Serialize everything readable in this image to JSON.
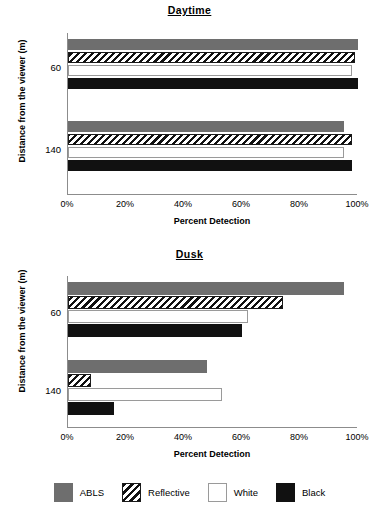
{
  "chart_data": [
    {
      "type": "bar",
      "orientation": "horizontal",
      "title": "Daytime",
      "xlabel": "Percent Detection",
      "ylabel": "Distance from the viewer (m)",
      "categories": [
        "60",
        "140"
      ],
      "xlim": [
        0,
        100
      ],
      "xticks": [
        0,
        20,
        40,
        60,
        80,
        100
      ],
      "xticklabels": [
        "0%",
        "20%",
        "40%",
        "60%",
        "80%",
        "100%"
      ],
      "grid": false,
      "legend_position": "bottom",
      "series": [
        {
          "name": "ABLS",
          "color": "#6e6e6e",
          "values": [
            100,
            95
          ]
        },
        {
          "name": "Reflective",
          "color": "hatched",
          "values": [
            99,
            98
          ]
        },
        {
          "name": "White",
          "color": "#ffffff",
          "values": [
            98,
            95
          ]
        },
        {
          "name": "Black",
          "color": "#111111",
          "values": [
            100,
            98
          ]
        }
      ]
    },
    {
      "type": "bar",
      "orientation": "horizontal",
      "title": "Dusk",
      "xlabel": "Percent Detection",
      "ylabel": "Distance from the viewer (m)",
      "categories": [
        "60",
        "140"
      ],
      "xlim": [
        0,
        100
      ],
      "xticks": [
        0,
        20,
        40,
        60,
        80,
        100
      ],
      "xticklabels": [
        "0%",
        "20%",
        "40%",
        "60%",
        "80%",
        "100%"
      ],
      "grid": false,
      "legend_position": "bottom",
      "series": [
        {
          "name": "ABLS",
          "color": "#6e6e6e",
          "values": [
            95,
            48
          ]
        },
        {
          "name": "Reflective",
          "color": "hatched",
          "values": [
            74,
            8
          ]
        },
        {
          "name": "White",
          "color": "#ffffff",
          "values": [
            62,
            53
          ]
        },
        {
          "name": "Black",
          "color": "#111111",
          "values": [
            60,
            16
          ]
        }
      ]
    }
  ],
  "daytime": {
    "title": "Daytime",
    "ylabel": "Distance from the viewer (m)",
    "xlabel": "Percent Detection",
    "yticks": [
      "60",
      "140"
    ],
    "xticklabels": [
      "0%",
      "20%",
      "40%",
      "60%",
      "80%",
      "100%"
    ]
  },
  "dusk": {
    "title": "Dusk",
    "ylabel": "Distance from the viewer (m)",
    "xlabel": "Percent Detection",
    "yticks": [
      "60",
      "140"
    ],
    "xticklabels": [
      "0%",
      "20%",
      "40%",
      "60%",
      "80%",
      "100%"
    ]
  },
  "legend": {
    "items": [
      {
        "label": "ABLS",
        "style": "solid-gray",
        "color": "#6e6e6e"
      },
      {
        "label": "Reflective",
        "style": "hatch",
        "color": "#111111"
      },
      {
        "label": "White",
        "style": "solid-white",
        "color": "#ffffff"
      },
      {
        "label": "Black",
        "style": "solid-black",
        "color": "#111111"
      }
    ]
  }
}
